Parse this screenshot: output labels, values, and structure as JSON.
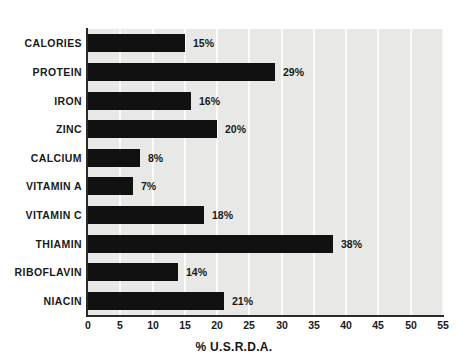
{
  "chart_data": {
    "type": "bar",
    "orientation": "horizontal",
    "title": "",
    "xlabel": "% U.S.R.D.A.",
    "ylabel": "",
    "xlim": [
      0,
      55
    ],
    "xticks": [
      0,
      5,
      10,
      15,
      20,
      25,
      30,
      35,
      40,
      45,
      50,
      55
    ],
    "grid": "vertical",
    "legend": "none",
    "value_label_suffix": "%",
    "categories": [
      "CALORIES",
      "PROTEIN",
      "IRON",
      "ZINC",
      "CALCIUM",
      "VITAMIN A",
      "VITAMIN C",
      "THIAMIN",
      "RIBOFLAVIN",
      "NIACIN"
    ],
    "values": [
      15,
      29,
      16,
      20,
      8,
      7,
      18,
      38,
      14,
      21
    ],
    "value_labels": [
      "15%",
      "29%",
      "16%",
      "20%",
      "8%",
      "7%",
      "18%",
      "38%",
      "14%",
      "21%"
    ],
    "bars": [
      {
        "label": "CALORIES",
        "value": 15,
        "value_label": "15%"
      },
      {
        "label": "PROTEIN",
        "value": 29,
        "value_label": "29%"
      },
      {
        "label": "IRON",
        "value": 16,
        "value_label": "16%"
      },
      {
        "label": "ZINC",
        "value": 20,
        "value_label": "20%"
      },
      {
        "label": "CALCIUM",
        "value": 8,
        "value_label": "8%"
      },
      {
        "label": "VITAMIN A",
        "value": 7,
        "value_label": "7%"
      },
      {
        "label": "VITAMIN C",
        "value": 18,
        "value_label": "18%"
      },
      {
        "label": "THIAMIN",
        "value": 38,
        "value_label": "38%"
      },
      {
        "label": "RIBOFLAVIN",
        "value": 14,
        "value_label": "14%"
      },
      {
        "label": "NIACIN",
        "value": 21,
        "value_label": "21%"
      }
    ],
    "colors": {
      "bar": "#111111",
      "plot_background": "#e8e8e6",
      "gridline": "#fbfbfa",
      "axis": "#2a2a2a",
      "text": "#1a1a1a",
      "page_background": "#ffffff"
    }
  }
}
